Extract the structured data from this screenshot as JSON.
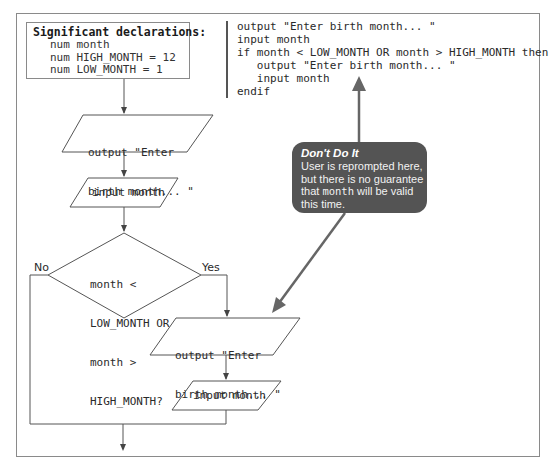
{
  "declarations": {
    "title": "Significant declarations:",
    "lines": [
      "num month",
      "num HIGH_MONTH = 12",
      "num LOW_MONTH = 1"
    ]
  },
  "pseudocode": {
    "lines": [
      "output \"Enter birth month... \"",
      "input month",
      "if month < LOW_MONTH OR month > HIGH_MONTH then",
      "   output \"Enter birth month... \"",
      "   input month",
      "endif"
    ]
  },
  "flowchart": {
    "output1": [
      "output \"Enter",
      "birth month... \""
    ],
    "input1": "input month",
    "decision": [
      "month <",
      "LOW_MONTH OR",
      "month >",
      "HIGH_MONTH?"
    ],
    "no_label": "No",
    "yes_label": "Yes",
    "output2": [
      "output \"Enter",
      "birth month... \""
    ],
    "input2": "input month"
  },
  "callout": {
    "title": "Don't Do It",
    "body_before": "User is reprompted here, but there is no guarantee that ",
    "body_code": "month",
    "body_after": " will be valid this time.",
    "background": "#545454"
  },
  "colors": {
    "line": "#555555",
    "frame": "#8a8a8a",
    "callout_arrow": "#666666"
  }
}
